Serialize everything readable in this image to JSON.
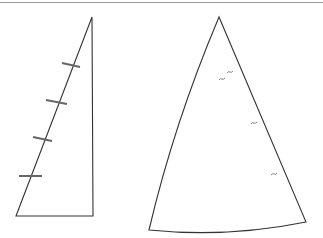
{
  "figure": {
    "colors": {
      "line": "#333333",
      "batten": "#666666",
      "border": "#9a9a9a",
      "background": "#ffffff"
    },
    "left_sail": {
      "points": "92,17 93,216 16,216",
      "battens": [
        {
          "x1": 62,
          "y1": 63,
          "x2": 80,
          "y2": 67
        },
        {
          "x1": 46,
          "y1": 100,
          "x2": 67,
          "y2": 104
        },
        {
          "x1": 33,
          "y1": 137,
          "x2": 52,
          "y2": 141
        },
        {
          "x1": 19,
          "y1": 176,
          "x2": 42,
          "y2": 176
        }
      ]
    },
    "right_sail": {
      "apex": [
        219,
        17
      ],
      "bottom_left": [
        149,
        230
      ],
      "bottom_right": [
        306,
        222
      ],
      "marks": [
        {
          "x": 230,
          "y": 72
        },
        {
          "x": 222,
          "y": 79
        },
        {
          "x": 254,
          "y": 123
        },
        {
          "x": 274,
          "y": 174
        }
      ]
    }
  }
}
